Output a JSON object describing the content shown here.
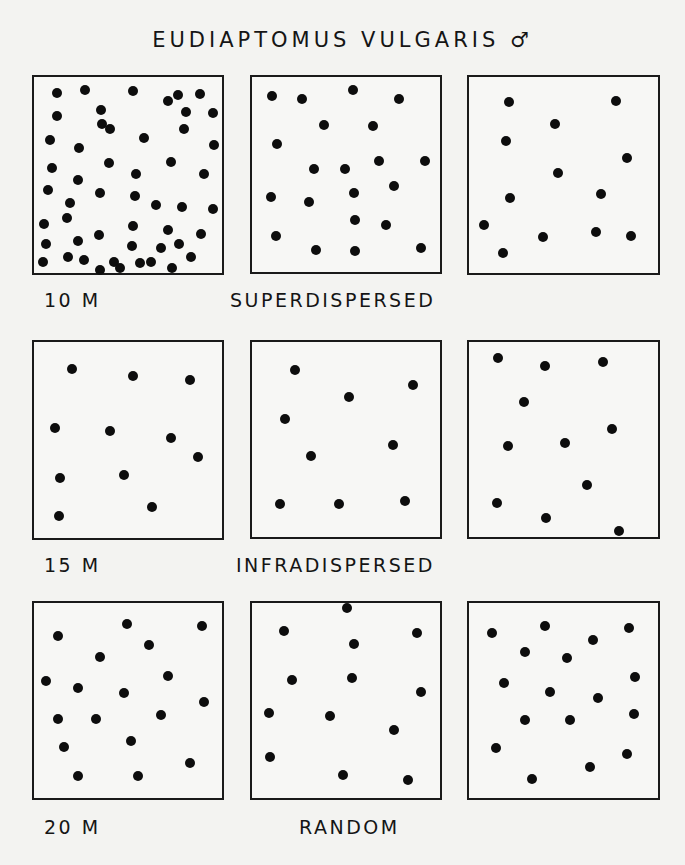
{
  "title": "EUDIAPTOMUS VULGARIS ♂",
  "rows": [
    {
      "depth_label": "10 M",
      "pattern_label": "SUPERDISPERSED",
      "depth_pos": [
        44,
        301
      ],
      "pattern_pos": [
        230,
        301
      ],
      "boxes": [
        {
          "x": 32,
          "y": 75,
          "w": 192,
          "h": 200,
          "dots": [
            [
              57,
              93
            ],
            [
              85,
              90
            ],
            [
              133,
              91
            ],
            [
              178,
              95
            ],
            [
              200,
              94
            ],
            [
              57,
              116
            ],
            [
              101,
              110
            ],
            [
              102,
              124
            ],
            [
              168,
              101
            ],
            [
              186,
              112
            ],
            [
              213,
              113
            ],
            [
              50,
              140
            ],
            [
              79,
              148
            ],
            [
              110,
              129
            ],
            [
              144,
              138
            ],
            [
              184,
              129
            ],
            [
              214,
              145
            ],
            [
              52,
              168
            ],
            [
              78,
              180
            ],
            [
              109,
              163
            ],
            [
              136,
              174
            ],
            [
              171,
              162
            ],
            [
              204,
              174
            ],
            [
              48,
              190
            ],
            [
              70,
              203
            ],
            [
              100,
              193
            ],
            [
              135,
              196
            ],
            [
              156,
              205
            ],
            [
              182,
              207
            ],
            [
              213,
              209
            ],
            [
              44,
              224
            ],
            [
              67,
              218
            ],
            [
              99,
              235
            ],
            [
              133,
              226
            ],
            [
              168,
              230
            ],
            [
              201,
              234
            ],
            [
              46,
              244
            ],
            [
              78,
              241
            ],
            [
              132,
              246
            ],
            [
              161,
              248
            ],
            [
              179,
              244
            ],
            [
              191,
              257
            ],
            [
              43,
              262
            ],
            [
              68,
              257
            ],
            [
              84,
              260
            ],
            [
              100,
              270
            ],
            [
              114,
              262
            ],
            [
              140,
              263
            ],
            [
              151,
              262
            ],
            [
              172,
              268
            ],
            [
              120,
              268
            ]
          ]
        },
        {
          "x": 250,
          "y": 75,
          "w": 192,
          "h": 199,
          "dots": [
            [
              272,
              96
            ],
            [
              302,
              99
            ],
            [
              353,
              90
            ],
            [
              399,
              99
            ],
            [
              324,
              125
            ],
            [
              373,
              126
            ],
            [
              277,
              144
            ],
            [
              314,
              169
            ],
            [
              345,
              169
            ],
            [
              379,
              161
            ],
            [
              425,
              161
            ],
            [
              394,
              186
            ],
            [
              271,
              197
            ],
            [
              309,
              202
            ],
            [
              354,
              193
            ],
            [
              355,
              220
            ],
            [
              386,
              225
            ],
            [
              276,
              236
            ],
            [
              316,
              250
            ],
            [
              355,
              251
            ],
            [
              421,
              248
            ]
          ]
        },
        {
          "x": 467,
          "y": 75,
          "w": 193,
          "h": 200,
          "dots": [
            [
              509,
              102
            ],
            [
              616,
              101
            ],
            [
              555,
              124
            ],
            [
              506,
              141
            ],
            [
              627,
              158
            ],
            [
              558,
              173
            ],
            [
              510,
              198
            ],
            [
              601,
              194
            ],
            [
              484,
              225
            ],
            [
              543,
              237
            ],
            [
              596,
              232
            ],
            [
              631,
              236
            ],
            [
              503,
              253
            ]
          ]
        }
      ]
    },
    {
      "depth_label": "15 M",
      "pattern_label": "INFRADISPERSED",
      "depth_pos": [
        44,
        566
      ],
      "pattern_pos": [
        236,
        566
      ],
      "boxes": [
        {
          "x": 32,
          "y": 340,
          "w": 192,
          "h": 200,
          "dots": [
            [
              72,
              369
            ],
            [
              133,
              376
            ],
            [
              190,
              380
            ],
            [
              55,
              428
            ],
            [
              110,
              431
            ],
            [
              171,
              438
            ],
            [
              198,
              457
            ],
            [
              60,
              478
            ],
            [
              124,
              475
            ],
            [
              152,
              507
            ],
            [
              59,
              516
            ]
          ]
        },
        {
          "x": 250,
          "y": 340,
          "w": 192,
          "h": 199,
          "dots": [
            [
              295,
              370
            ],
            [
              413,
              385
            ],
            [
              349,
              397
            ],
            [
              285,
              419
            ],
            [
              393,
              445
            ],
            [
              311,
              456
            ],
            [
              280,
              504
            ],
            [
              339,
              504
            ],
            [
              405,
              501
            ]
          ]
        },
        {
          "x": 467,
          "y": 340,
          "w": 193,
          "h": 199,
          "dots": [
            [
              498,
              358
            ],
            [
              545,
              366
            ],
            [
              603,
              362
            ],
            [
              524,
              402
            ],
            [
              612,
              429
            ],
            [
              508,
              446
            ],
            [
              565,
              443
            ],
            [
              587,
              485
            ],
            [
              497,
              503
            ],
            [
              546,
              518
            ],
            [
              619,
              531
            ]
          ]
        }
      ]
    },
    {
      "depth_label": "20 M",
      "pattern_label": "RANDOM",
      "depth_pos": [
        44,
        828
      ],
      "pattern_pos": [
        299,
        828
      ],
      "boxes": [
        {
          "x": 32,
          "y": 601,
          "w": 192,
          "h": 199,
          "dots": [
            [
              127,
              624
            ],
            [
              202,
              626
            ],
            [
              58,
              636
            ],
            [
              149,
              645
            ],
            [
              100,
              657
            ],
            [
              46,
              681
            ],
            [
              78,
              688
            ],
            [
              124,
              693
            ],
            [
              168,
              676
            ],
            [
              58,
              719
            ],
            [
              96,
              719
            ],
            [
              161,
              715
            ],
            [
              204,
              702
            ],
            [
              131,
              741
            ],
            [
              64,
              747
            ],
            [
              78,
              776
            ],
            [
              138,
              776
            ],
            [
              190,
              763
            ]
          ]
        },
        {
          "x": 250,
          "y": 601,
          "w": 192,
          "h": 199,
          "dots": [
            [
              347,
              608
            ],
            [
              284,
              631
            ],
            [
              417,
              633
            ],
            [
              354,
              644
            ],
            [
              292,
              680
            ],
            [
              352,
              678
            ],
            [
              421,
              692
            ],
            [
              269,
              713
            ],
            [
              330,
              716
            ],
            [
              394,
              730
            ],
            [
              270,
              757
            ],
            [
              343,
              775
            ],
            [
              408,
              780
            ]
          ]
        },
        {
          "x": 467,
          "y": 601,
          "w": 193,
          "h": 199,
          "dots": [
            [
              492,
              633
            ],
            [
              545,
              626
            ],
            [
              629,
              628
            ],
            [
              593,
              640
            ],
            [
              525,
              652
            ],
            [
              567,
              658
            ],
            [
              504,
              683
            ],
            [
              550,
              692
            ],
            [
              635,
              677
            ],
            [
              598,
              698
            ],
            [
              525,
              720
            ],
            [
              570,
              720
            ],
            [
              634,
              714
            ],
            [
              496,
              748
            ],
            [
              627,
              754
            ],
            [
              590,
              767
            ],
            [
              532,
              779
            ]
          ]
        }
      ]
    }
  ],
  "colors": {
    "background": "#f3f3f1",
    "ink": "#0d0d0d"
  }
}
